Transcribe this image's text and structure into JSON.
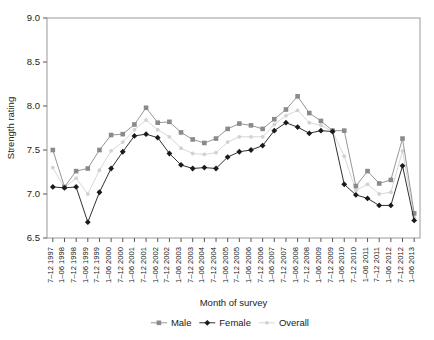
{
  "chart_data": {
    "type": "line",
    "title": "",
    "xlabel": "Month of survey",
    "ylabel": "Strength rating",
    "ylim": [
      6.5,
      9.0
    ],
    "yticks": [
      "6.5",
      "7.0",
      "7.5",
      "8.0",
      "8.5",
      "9.0"
    ],
    "ytick_values": [
      6.5,
      7.0,
      7.5,
      8.0,
      8.5,
      9.0
    ],
    "grid": false,
    "legend_position": "bottom",
    "categories": [
      "7–12 1997",
      "1–06 1998",
      "7–12 1998",
      "1–06 1999",
      "7–12 1999",
      "1–06 2000",
      "7–12 2000",
      "1–06 2001",
      "7–12 2001",
      "1–06 2002",
      "7–12 2002",
      "1–06 2003",
      "7–12 2003",
      "1–06 2004",
      "7–12 2004",
      "1–06 2005",
      "7–12 2005",
      "1–06 2006",
      "7–12 2006",
      "1–06 2007",
      "7–12 2007",
      "1–06 2008",
      "7–12 2008",
      "1–06 2009",
      "7–12 2009",
      "1–06 2010",
      "7–12 2010",
      "1–06 2011",
      "7–12 2011",
      "1–06 2012",
      "7–12 2012",
      "1–06 2013"
    ],
    "series": [
      {
        "name": "Male",
        "color": "#8a8a8a",
        "marker": "square",
        "values": [
          7.5,
          7.08,
          7.26,
          7.29,
          7.5,
          7.67,
          7.68,
          7.79,
          7.98,
          7.81,
          7.82,
          7.7,
          7.62,
          7.58,
          7.63,
          7.74,
          7.8,
          7.78,
          7.74,
          7.85,
          7.96,
          8.11,
          7.92,
          7.83,
          7.72,
          7.72,
          7.09,
          7.26,
          7.12,
          7.16,
          7.63,
          6.78
        ]
      },
      {
        "name": "Female",
        "color": "#1a1a1a",
        "marker": "diamond",
        "values": [
          7.08,
          7.07,
          7.08,
          6.68,
          7.02,
          7.29,
          7.48,
          7.66,
          7.68,
          7.64,
          7.46,
          7.33,
          7.29,
          7.3,
          7.29,
          7.42,
          7.48,
          7.5,
          7.55,
          7.72,
          7.81,
          7.76,
          7.69,
          7.72,
          7.71,
          7.11,
          6.99,
          6.95,
          6.87,
          6.87,
          7.32,
          6.7
        ]
      },
      {
        "name": "Overall",
        "color": "#d2d2d2",
        "marker": "dot",
        "values": [
          7.3,
          7.07,
          7.18,
          7.0,
          7.27,
          7.49,
          7.59,
          7.73,
          7.84,
          7.73,
          7.65,
          7.52,
          7.46,
          7.45,
          7.47,
          7.59,
          7.65,
          7.65,
          7.65,
          7.79,
          7.89,
          7.95,
          7.81,
          7.78,
          7.71,
          7.43,
          7.04,
          7.11,
          7.0,
          7.02,
          7.49,
          6.74
        ]
      }
    ],
    "legend": [
      {
        "label": "Male",
        "color": "#8a8a8a",
        "marker": "square"
      },
      {
        "label": "Female",
        "color": "#1a1a1a",
        "marker": "diamond"
      },
      {
        "label": "Overall",
        "color": "#d2d2d2",
        "marker": "dot"
      }
    ]
  }
}
